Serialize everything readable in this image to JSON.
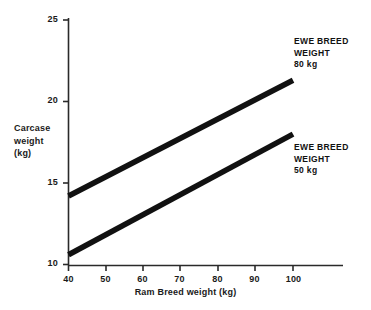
{
  "chart_data": {
    "type": "line",
    "title": "",
    "subtitle": "",
    "xlabel": "Ram Breed weight (kg)",
    "ylabel": "Carcase weight (kg)",
    "ylabel_lines": [
      "Carcase",
      "weight",
      "(kg)"
    ],
    "xlim": [
      40,
      100
    ],
    "ylim": [
      10,
      25
    ],
    "x_ticks": [
      40,
      50,
      60,
      70,
      80,
      90,
      100
    ],
    "y_ticks": [
      10,
      15,
      20,
      25
    ],
    "x_tick_labels": [
      "40",
      "50",
      "60",
      "70",
      "80",
      "90",
      "100"
    ],
    "y_tick_labels": [
      "10",
      "15",
      "20",
      "25"
    ],
    "grid": false,
    "legend_position": "inline-right",
    "series": [
      {
        "name": "EWE BREED WEIGHT 80 kg",
        "annotation_lines": [
          "EWE BREED",
          "WEIGHT",
          "80 kg"
        ],
        "color": "#111111",
        "x": [
          40,
          100
        ],
        "values": [
          14.2,
          21.3
        ]
      },
      {
        "name": "EWE BREED WEIGHT 50 kg",
        "annotation_lines": [
          "EWE BREED",
          "WEIGHT",
          "50 kg"
        ],
        "color": "#111111",
        "x": [
          40,
          100
        ],
        "values": [
          10.6,
          18.0
        ]
      }
    ],
    "axis_color": "#1a1a1a",
    "background_color": "#ffffff"
  }
}
